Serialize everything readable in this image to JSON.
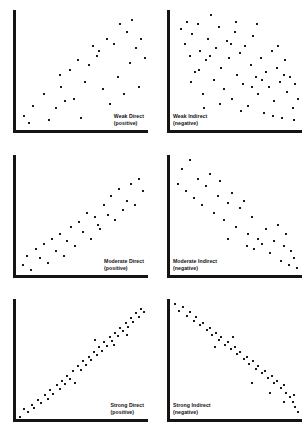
{
  "figure": {
    "title": "",
    "background": "#ffffff",
    "axis_color": "#141414",
    "point_color": "#1a1a1a",
    "layout": {
      "rows": 3,
      "cols": 2
    }
  },
  "chart_data": [
    {
      "type": "scatter",
      "title": "Weak Direct",
      "subtitle": "(positive)",
      "caption_position": "bottom-right",
      "relationship": "weak positive",
      "xlabel": "",
      "ylabel": "",
      "xlim": [
        0,
        100
      ],
      "ylim": [
        0,
        100
      ],
      "grid": false,
      "legend": "none",
      "n_points": 32,
      "points": [
        [
          6,
          12
        ],
        [
          10,
          6
        ],
        [
          13,
          20
        ],
        [
          21,
          30
        ],
        [
          25,
          8
        ],
        [
          30,
          18
        ],
        [
          33,
          46
        ],
        [
          34,
          36
        ],
        [
          37,
          24
        ],
        [
          41,
          50
        ],
        [
          44,
          26
        ],
        [
          47,
          58
        ],
        [
          49,
          10
        ],
        [
          52,
          40
        ],
        [
          55,
          54
        ],
        [
          58,
          70
        ],
        [
          61,
          62
        ],
        [
          63,
          66
        ],
        [
          66,
          34
        ],
        [
          69,
          76
        ],
        [
          71,
          22
        ],
        [
          74,
          72
        ],
        [
          77,
          44
        ],
        [
          79,
          88
        ],
        [
          82,
          30
        ],
        [
          84,
          82
        ],
        [
          86,
          56
        ],
        [
          88,
          92
        ],
        [
          91,
          68
        ],
        [
          93,
          36
        ],
        [
          95,
          76
        ],
        [
          98,
          60
        ]
      ]
    },
    {
      "type": "scatter",
      "title": "Weak Indirect",
      "subtitle": "(negative)",
      "caption_position": "bottom-left",
      "relationship": "weak negative",
      "xlabel": "",
      "ylabel": "",
      "xlim": [
        0,
        100
      ],
      "ylim": [
        0,
        100
      ],
      "grid": false,
      "legend": "none",
      "n_points": 60,
      "points": [
        [
          8,
          84
        ],
        [
          11,
          72
        ],
        [
          13,
          90
        ],
        [
          15,
          62
        ],
        [
          17,
          80
        ],
        [
          19,
          48
        ],
        [
          21,
          88
        ],
        [
          23,
          66
        ],
        [
          25,
          30
        ],
        [
          27,
          58
        ],
        [
          29,
          76
        ],
        [
          31,
          96
        ],
        [
          33,
          42
        ],
        [
          35,
          68
        ],
        [
          37,
          86
        ],
        [
          39,
          52
        ],
        [
          41,
          34
        ],
        [
          43,
          74
        ],
        [
          45,
          60
        ],
        [
          47,
          26
        ],
        [
          49,
          82
        ],
        [
          51,
          46
        ],
        [
          53,
          64
        ],
        [
          55,
          38
        ],
        [
          57,
          70
        ],
        [
          59,
          20
        ],
        [
          61,
          54
        ],
        [
          63,
          78
        ],
        [
          65,
          44
        ],
        [
          67,
          30
        ],
        [
          69,
          60
        ],
        [
          71,
          14
        ],
        [
          73,
          48
        ],
        [
          75,
          36
        ],
        [
          77,
          66
        ],
        [
          79,
          24
        ],
        [
          81,
          52
        ],
        [
          83,
          40
        ],
        [
          85,
          10
        ],
        [
          87,
          58
        ],
        [
          89,
          32
        ],
        [
          91,
          44
        ],
        [
          93,
          18
        ],
        [
          95,
          38
        ],
        [
          97,
          26
        ],
        [
          22,
          50
        ],
        [
          30,
          62
        ],
        [
          38,
          22
        ],
        [
          46,
          72
        ],
        [
          54,
          16
        ],
        [
          62,
          36
        ],
        [
          70,
          42
        ],
        [
          78,
          12
        ],
        [
          86,
          46
        ],
        [
          94,
          8
        ],
        [
          16,
          40
        ],
        [
          26,
          18
        ],
        [
          50,
          90
        ],
        [
          66,
          88
        ],
        [
          82,
          70
        ]
      ]
    },
    {
      "type": "scatter",
      "title": "Moderate Direct",
      "subtitle": "(positive)",
      "caption_position": "bottom-right",
      "relationship": "moderate positive",
      "xlabel": "",
      "ylabel": "",
      "xlim": [
        0,
        100
      ],
      "ylim": [
        0,
        100
      ],
      "grid": false,
      "legend": "none",
      "n_points": 32,
      "points": [
        [
          5,
          8
        ],
        [
          8,
          16
        ],
        [
          11,
          4
        ],
        [
          15,
          22
        ],
        [
          18,
          14
        ],
        [
          21,
          26
        ],
        [
          24,
          10
        ],
        [
          27,
          30
        ],
        [
          30,
          20
        ],
        [
          33,
          34
        ],
        [
          36,
          16
        ],
        [
          39,
          28
        ],
        [
          42,
          40
        ],
        [
          45,
          24
        ],
        [
          48,
          44
        ],
        [
          51,
          36
        ],
        [
          54,
          52
        ],
        [
          57,
          30
        ],
        [
          60,
          48
        ],
        [
          62,
          42
        ],
        [
          64,
          38
        ],
        [
          67,
          58
        ],
        [
          70,
          50
        ],
        [
          72,
          66
        ],
        [
          75,
          46
        ],
        [
          78,
          72
        ],
        [
          81,
          54
        ],
        [
          84,
          62
        ],
        [
          87,
          76
        ],
        [
          90,
          58
        ],
        [
          93,
          80
        ],
        [
          96,
          70
        ]
      ]
    },
    {
      "type": "scatter",
      "title": "Moderate Indirect",
      "subtitle": "(negative)",
      "caption_position": "bottom-left",
      "relationship": "moderate negative",
      "xlabel": "",
      "ylabel": "",
      "xlim": [
        0,
        100
      ],
      "ylim": [
        0,
        100
      ],
      "grid": false,
      "legend": "none",
      "n_points": 36,
      "points": [
        [
          6,
          76
        ],
        [
          9,
          88
        ],
        [
          12,
          70
        ],
        [
          15,
          96
        ],
        [
          18,
          64
        ],
        [
          21,
          80
        ],
        [
          24,
          58
        ],
        [
          27,
          74
        ],
        [
          30,
          84
        ],
        [
          33,
          52
        ],
        [
          36,
          66
        ],
        [
          38,
          78
        ],
        [
          41,
          46
        ],
        [
          44,
          60
        ],
        [
          47,
          68
        ],
        [
          50,
          40
        ],
        [
          53,
          56
        ],
        [
          56,
          62
        ],
        [
          59,
          34
        ],
        [
          62,
          48
        ],
        [
          64,
          22
        ],
        [
          67,
          30
        ],
        [
          70,
          26
        ],
        [
          73,
          38
        ],
        [
          76,
          18
        ],
        [
          79,
          28
        ],
        [
          82,
          42
        ],
        [
          84,
          12
        ],
        [
          86,
          24
        ],
        [
          88,
          34
        ],
        [
          90,
          8
        ],
        [
          92,
          20
        ],
        [
          94,
          14
        ],
        [
          96,
          6
        ],
        [
          44,
          30
        ],
        [
          58,
          24
        ]
      ]
    },
    {
      "type": "scatter",
      "title": "Strong Direct",
      "subtitle": "(positive)",
      "caption_position": "bottom-right",
      "relationship": "strong positive",
      "xlabel": "",
      "ylabel": "",
      "xlim": [
        0,
        100
      ],
      "ylim": [
        0,
        100
      ],
      "grid": false,
      "legend": "none",
      "n_points": 48,
      "points": [
        [
          3,
          2
        ],
        [
          6,
          8
        ],
        [
          9,
          6
        ],
        [
          12,
          12
        ],
        [
          14,
          9
        ],
        [
          17,
          16
        ],
        [
          19,
          13
        ],
        [
          22,
          20
        ],
        [
          24,
          17
        ],
        [
          26,
          24
        ],
        [
          28,
          21
        ],
        [
          31,
          28
        ],
        [
          33,
          25
        ],
        [
          35,
          32
        ],
        [
          37,
          29
        ],
        [
          39,
          36
        ],
        [
          41,
          33
        ],
        [
          43,
          40
        ],
        [
          45,
          30
        ],
        [
          47,
          44
        ],
        [
          49,
          41
        ],
        [
          51,
          48
        ],
        [
          53,
          45
        ],
        [
          55,
          52
        ],
        [
          57,
          49
        ],
        [
          59,
          56
        ],
        [
          61,
          53
        ],
        [
          63,
          60
        ],
        [
          65,
          57
        ],
        [
          67,
          64
        ],
        [
          69,
          61
        ],
        [
          71,
          68
        ],
        [
          73,
          65
        ],
        [
          75,
          72
        ],
        [
          77,
          69
        ],
        [
          79,
          76
        ],
        [
          81,
          73
        ],
        [
          83,
          80
        ],
        [
          85,
          77
        ],
        [
          87,
          84
        ],
        [
          89,
          81
        ],
        [
          91,
          88
        ],
        [
          93,
          85
        ],
        [
          95,
          92
        ],
        [
          97,
          89
        ],
        [
          60,
          66
        ],
        [
          74,
          62
        ],
        [
          84,
          70
        ]
      ]
    },
    {
      "type": "scatter",
      "title": "Strong Indirect",
      "subtitle": "(negative)",
      "caption_position": "bottom-left",
      "relationship": "strong negative",
      "xlabel": "",
      "ylabel": "",
      "xlim": [
        0,
        100
      ],
      "ylim": [
        0,
        100
      ],
      "grid": false,
      "legend": "none",
      "n_points": 46,
      "points": [
        [
          4,
          96
        ],
        [
          7,
          90
        ],
        [
          10,
          93
        ],
        [
          13,
          86
        ],
        [
          15,
          89
        ],
        [
          18,
          82
        ],
        [
          20,
          85
        ],
        [
          23,
          78
        ],
        [
          25,
          80
        ],
        [
          28,
          74
        ],
        [
          30,
          76
        ],
        [
          32,
          70
        ],
        [
          35,
          72
        ],
        [
          37,
          66
        ],
        [
          39,
          68
        ],
        [
          42,
          62
        ],
        [
          44,
          64
        ],
        [
          46,
          58
        ],
        [
          49,
          60
        ],
        [
          51,
          54
        ],
        [
          53,
          56
        ],
        [
          56,
          50
        ],
        [
          58,
          52
        ],
        [
          60,
          46
        ],
        [
          63,
          48
        ],
        [
          65,
          42
        ],
        [
          67,
          44
        ],
        [
          70,
          38
        ],
        [
          72,
          40
        ],
        [
          74,
          34
        ],
        [
          77,
          36
        ],
        [
          79,
          30
        ],
        [
          81,
          32
        ],
        [
          84,
          26
        ],
        [
          86,
          28
        ],
        [
          88,
          22
        ],
        [
          91,
          18
        ],
        [
          93,
          14
        ],
        [
          95,
          10
        ],
        [
          97,
          6
        ],
        [
          34,
          60
        ],
        [
          48,
          68
        ],
        [
          62,
          30
        ],
        [
          76,
          22
        ],
        [
          86,
          14
        ],
        [
          94,
          20
        ]
      ]
    }
  ]
}
